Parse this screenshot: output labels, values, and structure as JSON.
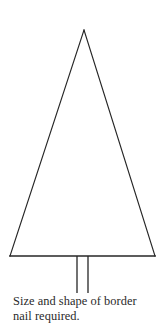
{
  "figure": {
    "title": "Size and shape of border nail",
    "background_color": "#ffffff",
    "stroke_color": "#262626",
    "caption": {
      "line1": "Size and shape of border",
      "line2": "nail required."
    },
    "shapes": {
      "triangle": {
        "name": "isosceles-triangle-head",
        "apex": {
          "x": 84,
          "y": 30
        },
        "base_left": {
          "x": 10,
          "y": 256
        },
        "base_right": {
          "x": 155,
          "y": 256
        },
        "stroke_width": 1.1,
        "fill": "none"
      },
      "base_line": {
        "name": "triangle-base-line",
        "x1": 10,
        "y1": 256,
        "x2": 155,
        "y2": 256,
        "stroke_width": 1.6
      },
      "nail_shank": {
        "name": "nail-shank",
        "left_x": 77,
        "right_x": 88,
        "top_y": 256,
        "bottom_y": 293,
        "stroke_width": 1.3
      }
    }
  }
}
